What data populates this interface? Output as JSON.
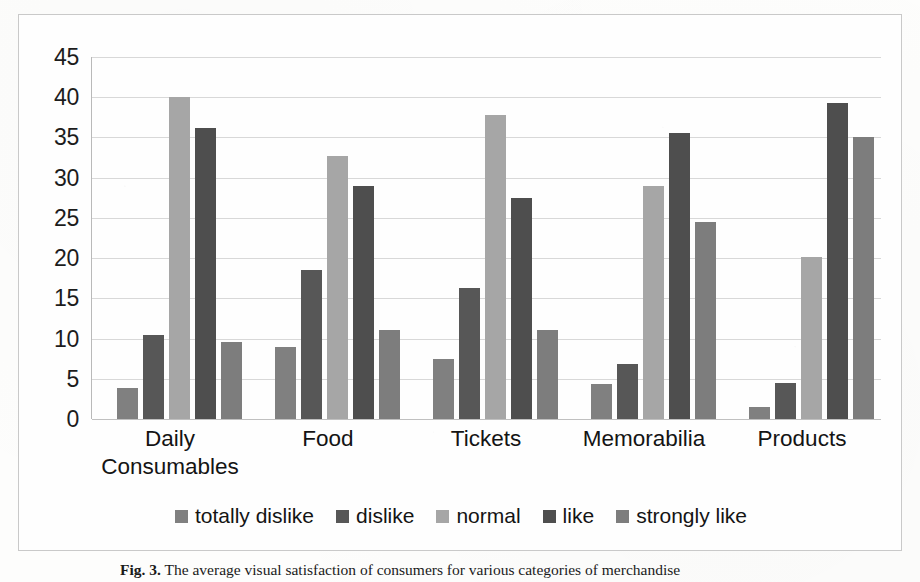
{
  "figure": {
    "caption_label": "Fig. 3.",
    "caption_text": "The average visual satisfaction of consumers for various categories of merchandise"
  },
  "chart_data": {
    "type": "bar",
    "title": "",
    "xlabel": "",
    "ylabel": "",
    "ylim": [
      0,
      45
    ],
    "yticks": [
      0,
      5,
      10,
      15,
      20,
      25,
      30,
      35,
      40,
      45
    ],
    "grid": true,
    "legend_position": "bottom",
    "categories": [
      "Daily\nConsumables",
      "Food",
      "Tickets",
      "Memorabilia",
      "Products"
    ],
    "category_labels_flat": [
      "Daily Consumables",
      "Food",
      "Tickets",
      "Memorabilia",
      "Products"
    ],
    "series": [
      {
        "name": "totally dislike",
        "color": "#808080",
        "values": [
          3.8,
          9.0,
          7.5,
          4.4,
          1.5
        ]
      },
      {
        "name": "dislike",
        "color": "#575757",
        "values": [
          10.4,
          18.5,
          16.3,
          6.8,
          4.5
        ]
      },
      {
        "name": "normal",
        "color": "#a6a6a6",
        "values": [
          40.0,
          32.7,
          37.8,
          29.0,
          20.2
        ]
      },
      {
        "name": "like",
        "color": "#4e4e4e",
        "values": [
          36.2,
          29.0,
          27.5,
          35.6,
          39.3
        ]
      },
      {
        "name": "strongly like",
        "color": "#7d7d7d",
        "values": [
          9.6,
          11.1,
          11.1,
          24.5,
          35.0
        ]
      }
    ]
  },
  "legend": {
    "items": [
      {
        "label": "totally dislike",
        "color": "#808080"
      },
      {
        "label": "dislike",
        "color": "#575757"
      },
      {
        "label": "normal",
        "color": "#a6a6a6"
      },
      {
        "label": "like",
        "color": "#4e4e4e"
      },
      {
        "label": "strongly like",
        "color": "#7d7d7d"
      }
    ]
  },
  "colors": {
    "gridline": "#d8d8d8",
    "frame_border": "#c9c9c9",
    "text": "#1a1a1a",
    "background": "#fefefe"
  }
}
